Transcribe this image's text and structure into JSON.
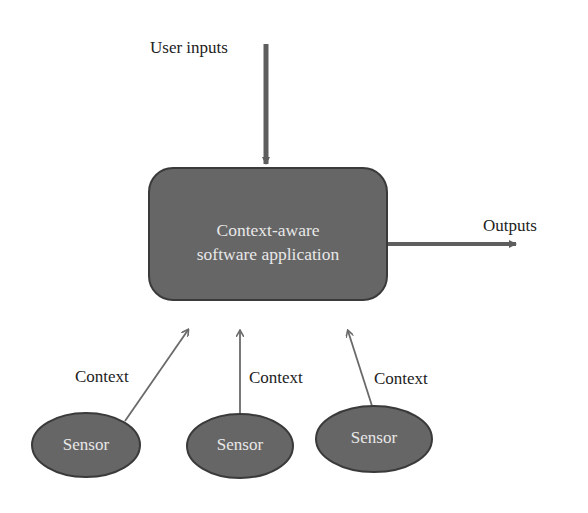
{
  "diagram": {
    "main_box": {
      "line1": "Context-aware",
      "line2": "software application"
    },
    "inputs_label": "User inputs",
    "outputs_label": "Outputs",
    "context_labels": [
      "Context",
      "Context",
      "Context"
    ],
    "sensors": [
      {
        "label": "Sensor"
      },
      {
        "label": "Sensor"
      },
      {
        "label": "Sensor"
      }
    ],
    "colors": {
      "box_fill": "#666666",
      "box_stroke": "#3a3a3a",
      "arrow": "#6a6a6a",
      "text_light": "#e8e8e8",
      "text_dark": "#222222"
    }
  }
}
